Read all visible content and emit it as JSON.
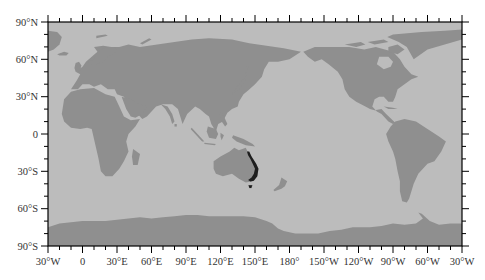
{
  "map": {
    "projection": "equirectangular (cylindrical equidistant), central meridian 150°E",
    "extent": {
      "lon_min": "30°W",
      "lon_max": "30°W (330°E)",
      "lat_min": -90,
      "lat_max": 90
    },
    "colors": {
      "ocean": "#bcbcbc",
      "land": "#8f8f8f",
      "highlight": "#1e1e1e",
      "frame": "#000000",
      "label": "#333333"
    },
    "y_axis": {
      "ticks": [
        {
          "lat": 90,
          "label": "90°N"
        },
        {
          "lat": 60,
          "label": "60°N"
        },
        {
          "lat": 30,
          "label": "30°N"
        },
        {
          "lat": 0,
          "label": "0"
        },
        {
          "lat": -30,
          "label": "30°S"
        },
        {
          "lat": -60,
          "label": "60°S"
        },
        {
          "lat": -90,
          "label": "90°S"
        }
      ],
      "minor_step_deg": 10
    },
    "x_axis": {
      "ticks": [
        {
          "offset": 0,
          "label": "30°W"
        },
        {
          "offset": 30,
          "label": "0"
        },
        {
          "offset": 60,
          "label": "30°E"
        },
        {
          "offset": 90,
          "label": "60°E"
        },
        {
          "offset": 120,
          "label": "90°E"
        },
        {
          "offset": 150,
          "label": "120°E"
        },
        {
          "offset": 180,
          "label": "150°E"
        },
        {
          "offset": 210,
          "label": "180°"
        },
        {
          "offset": 240,
          "label": "150°W"
        },
        {
          "offset": 270,
          "label": "120°W"
        },
        {
          "offset": 300,
          "label": "90°W"
        },
        {
          "offset": 330,
          "label": "60°W"
        },
        {
          "offset": 360,
          "label": "30°W"
        }
      ],
      "minor_step_deg": 10
    },
    "highlight_region": {
      "name": "Eastern Australia coastal band (incl. Tasmania)",
      "lon_range": "~145°E–154°E",
      "lat_range": "~-15° to -44°"
    }
  }
}
